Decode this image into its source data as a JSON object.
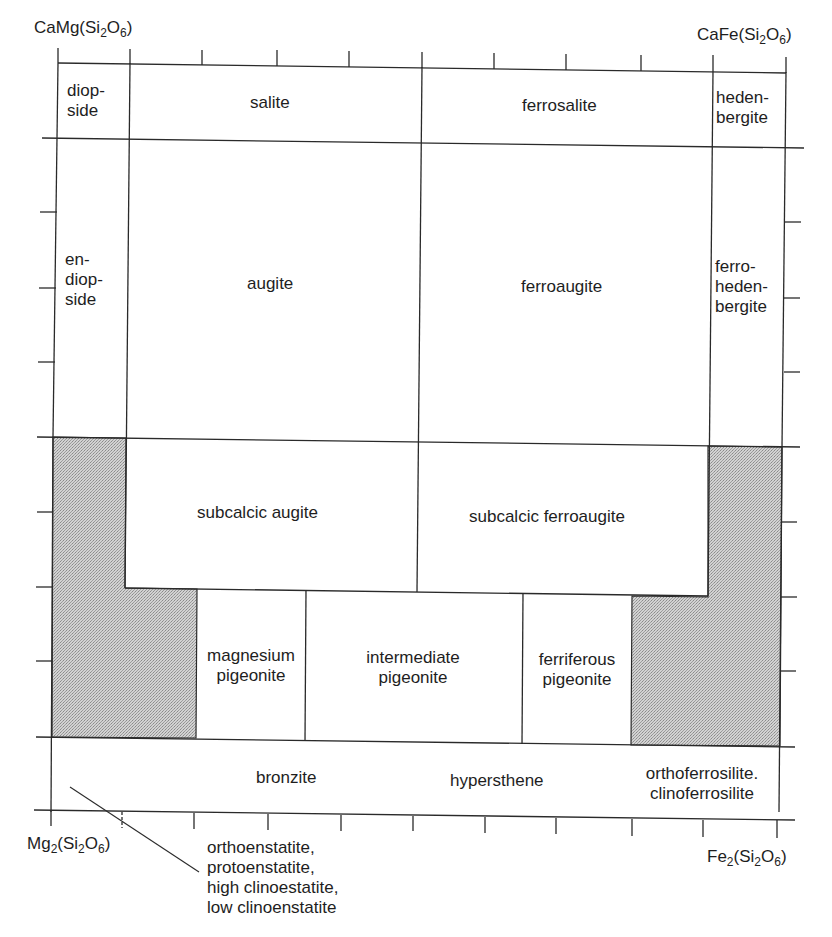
{
  "colors": {
    "line": "#2a2a2a",
    "stipple_fill": "#c4c4c4",
    "background": "#ffffff",
    "text": "#1e1e1e"
  },
  "corners": {
    "top_left": {
      "prefix": "CaMg(Si",
      "sub1": "2",
      "mid": "O",
      "sub2": "6",
      "suffix": ")"
    },
    "top_right": {
      "prefix": "CaFe(Si",
      "sub1": "2",
      "mid": "O",
      "sub2": "6",
      "suffix": ")"
    },
    "bottom_left": {
      "prefix": "Mg",
      "sub0": "2",
      "open": "(Si",
      "sub1": "2",
      "mid": "O",
      "sub2": "6",
      "suffix": ")"
    },
    "bottom_right": {
      "prefix": "Fe",
      "sub0": "2",
      "open": "(Si",
      "sub1": "2",
      "mid": "O",
      "sub2": "6",
      "suffix": ")"
    }
  },
  "fields": {
    "diopside": "diop-\nside",
    "salite": "salite",
    "ferrosalite": "ferrosalite",
    "hedenbergite": "heden-\nbergite",
    "endiopside": "en-\ndiop-\nside",
    "augite": "augite",
    "ferroaugite": "ferroaugite",
    "ferrohedenbergite": "ferro-\nheden-\nbergite",
    "subcalcic_augite": "subcalcic augite",
    "subcalcic_ferroaugite": "subcalcic ferroaugite",
    "magnesium_pigeonite": "magnesium\npigeonite",
    "intermediate_pigeonite": "intermediate\npigeonite",
    "ferriferous_pigeonite": "ferriferous\npigeonite",
    "bronzite": "bronzite",
    "hypersthene": "hypersthene",
    "orthoferrosilite": "orthoferrosilite.\nclinoferrosilite",
    "enstatite_callout": "orthoenstatite,\nprotoenstatite,\nhigh clinoestatite,\nlow clinoenstatite"
  },
  "axes": {
    "top_ticks": 10,
    "bottom_ticks": 10,
    "left_ticks": 8,
    "right_ticks": 8,
    "shaded_regions": [
      "mg-rich-miscibility-gap",
      "fe-rich-miscibility-gap"
    ]
  }
}
